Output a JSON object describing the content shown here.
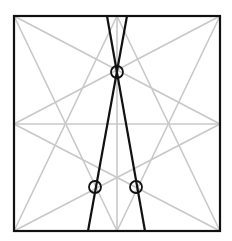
{
  "canvas": {
    "width": 232,
    "height": 241,
    "background": "#ffffff"
  },
  "colors": {
    "frame": "#111111",
    "construction": "#c8c8c8",
    "highlight": "#111111"
  },
  "frame": {
    "x1": 14,
    "y1": 16,
    "x2": 220,
    "y2": 231,
    "stroke_width": 2.2
  },
  "key_points": {
    "top_left": [
      14,
      16
    ],
    "top_mid": [
      117,
      16
    ],
    "top_right": [
      220,
      16
    ],
    "mid_left": [
      14,
      124
    ],
    "center": [
      117,
      124
    ],
    "mid_right": [
      220,
      124
    ],
    "bottom_left": [
      14,
      231
    ],
    "bottom_mid": [
      117,
      231
    ],
    "bottom_right": [
      220,
      231
    ]
  },
  "construction_lines": [
    {
      "name": "horizontal-center-line",
      "from": [
        14,
        124
      ],
      "to": [
        220,
        124
      ]
    },
    {
      "name": "vertical-center-line",
      "from": [
        117,
        16
      ],
      "to": [
        117,
        231
      ]
    },
    {
      "name": "top-left-to-mid-right",
      "from": [
        14,
        16
      ],
      "to": [
        220,
        124
      ]
    },
    {
      "name": "top-left-to-bottom-mid",
      "from": [
        14,
        16
      ],
      "to": [
        117,
        231
      ]
    },
    {
      "name": "top-right-to-mid-left",
      "from": [
        220,
        16
      ],
      "to": [
        14,
        124
      ]
    },
    {
      "name": "top-right-to-bottom-mid",
      "from": [
        220,
        16
      ],
      "to": [
        117,
        231
      ]
    },
    {
      "name": "bottom-left-to-mid-right",
      "from": [
        14,
        231
      ],
      "to": [
        220,
        124
      ]
    },
    {
      "name": "bottom-left-to-top-mid",
      "from": [
        14,
        231
      ],
      "to": [
        117,
        16
      ]
    },
    {
      "name": "bottom-right-to-mid-left",
      "from": [
        220,
        231
      ],
      "to": [
        14,
        124
      ]
    },
    {
      "name": "bottom-right-to-top-mid",
      "from": [
        220,
        231
      ],
      "to": [
        117,
        16
      ]
    }
  ],
  "highlight_lines": [
    {
      "name": "black-line-left-leaning",
      "from": [
        127,
        16
      ],
      "to": [
        88,
        231
      ]
    },
    {
      "name": "black-line-right-leaning",
      "from": [
        107,
        16
      ],
      "to": [
        145,
        231
      ]
    }
  ],
  "markers": [
    {
      "name": "circle-marker-top-crossing",
      "cx": 117,
      "cy": 72,
      "r": 6
    },
    {
      "name": "circle-marker-bottom-left",
      "cx": 95,
      "cy": 187,
      "r": 6
    },
    {
      "name": "circle-marker-bottom-right",
      "cx": 136,
      "cy": 187,
      "r": 6
    }
  ]
}
